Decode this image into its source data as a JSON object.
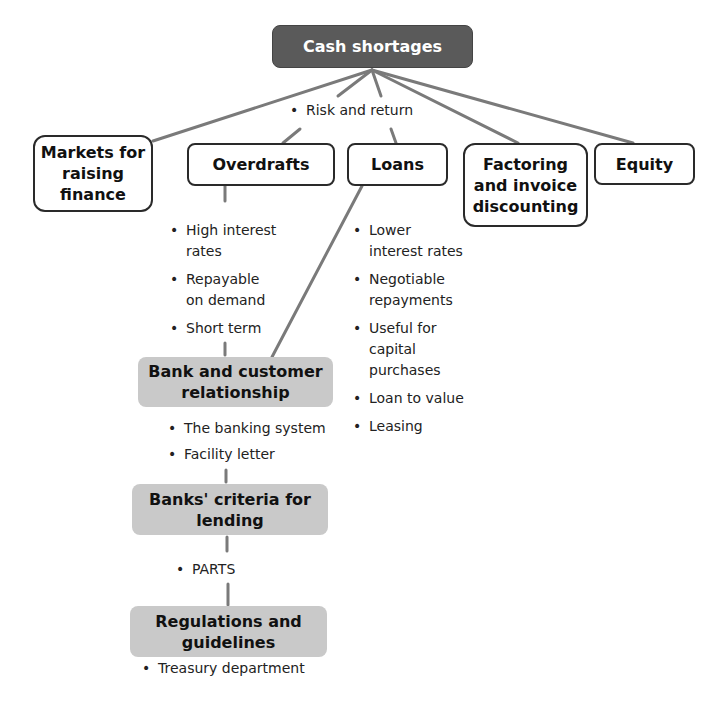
{
  "root": {
    "label": "Cash shortages",
    "note": "Risk and return"
  },
  "branches": [
    {
      "id": "markets",
      "label": "Markets for raising finance"
    },
    {
      "id": "overdrafts",
      "label": "Overdrafts",
      "points": [
        "High interest\nrates",
        "Repayable\non demand",
        "Short term"
      ]
    },
    {
      "id": "loans",
      "label": "Loans",
      "points": [
        "Lower\ninterest rates",
        "Negotiable\nrepayments",
        "Useful for\ncapital\npurchases",
        "Loan to value",
        "Leasing"
      ]
    },
    {
      "id": "factoring",
      "label": "Factoring and invoice discounting"
    },
    {
      "id": "equity",
      "label": "Equity"
    }
  ],
  "chain": [
    {
      "id": "bank-relationship",
      "label": "Bank and customer relationship",
      "points": [
        "The banking system",
        "Facility letter"
      ]
    },
    {
      "id": "banks-criteria",
      "label": "Banks' criteria for lending",
      "points": [
        "PARTS"
      ]
    },
    {
      "id": "regulations",
      "label": "Regulations and guidelines",
      "points": [
        "Treasury department"
      ]
    }
  ],
  "colors": {
    "root_fill": "#5a5a5a",
    "chain_fill": "#c9c9c9",
    "connector": "#7a7a7a",
    "outline": "#2a2a2a"
  }
}
